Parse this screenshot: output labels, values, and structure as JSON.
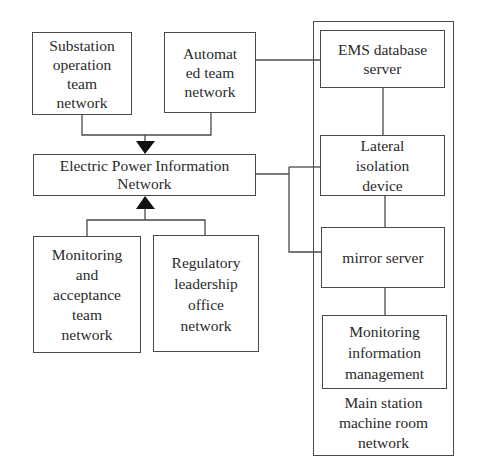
{
  "diagram": {
    "nodes": {
      "substation": {
        "label": "Substation\noperation\nteam\nnetwork"
      },
      "automated": {
        "label": "Automat\ned team\nnetwork"
      },
      "electric_power": {
        "label": "Electric Power Information\nNetwork"
      },
      "monitoring_acceptance": {
        "label": "Monitoring\nand\nacceptance\nteam\nnetwork"
      },
      "regulatory": {
        "label": "Regulatory\nleadership\noffice\nnetwork"
      },
      "ems": {
        "label": "EMS database\nserver"
      },
      "lateral": {
        "label": "Lateral\nisolation\ndevice"
      },
      "mirror": {
        "label": "mirror server"
      },
      "monitoring_info": {
        "label": "Monitoring\ninformation\nmanagement"
      }
    },
    "group": {
      "main_station": {
        "label": "Main station\nmachine room\nnetwork"
      }
    },
    "edges": [
      {
        "from": "substation",
        "to": "electric_power",
        "arrow": "down"
      },
      {
        "from": "automated",
        "to": "electric_power",
        "arrow": "down"
      },
      {
        "from": "monitoring_acceptance",
        "to": "electric_power",
        "arrow": "up"
      },
      {
        "from": "regulatory",
        "to": "electric_power",
        "arrow": "up"
      },
      {
        "from": "automated",
        "to": "ems",
        "arrow": "none"
      },
      {
        "from": "electric_power",
        "to": "lateral",
        "arrow": "none"
      },
      {
        "from": "electric_power",
        "to": "mirror",
        "arrow": "none"
      },
      {
        "from": "ems",
        "to": "lateral",
        "arrow": "none"
      },
      {
        "from": "lateral",
        "to": "mirror",
        "arrow": "none"
      },
      {
        "from": "mirror",
        "to": "monitoring_info",
        "arrow": "none"
      }
    ]
  }
}
